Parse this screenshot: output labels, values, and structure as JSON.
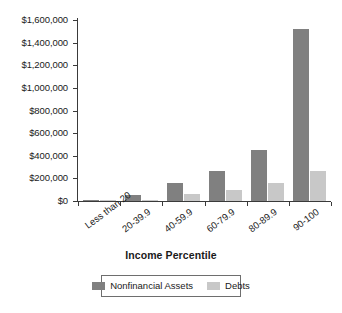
{
  "chart_data": {
    "type": "bar",
    "title": "",
    "xlabel": "Income Percentile",
    "ylabel": "",
    "categories": [
      "Less than 20",
      "20-39.9",
      "40-59.9",
      "60-79.9",
      "80-89.9",
      "90-100"
    ],
    "series": [
      {
        "name": "Nonfinancial Assets",
        "color": "#808080",
        "values": [
          10000,
          55000,
          150000,
          260000,
          435000,
          1470000
        ]
      },
      {
        "name": "Debts",
        "color": "#c8c8c8",
        "values": [
          5000,
          10000,
          60000,
          95000,
          150000,
          255000
        ]
      }
    ],
    "ylim": [
      0,
      1600000
    ],
    "ytick_labels": [
      "$1,600,000",
      "$1,400,000",
      "$1,200,000",
      "$1,000,000",
      "$800,000",
      "$600,000",
      "$400,000",
      "$200,000",
      "$0"
    ],
    "ytick_values": [
      1600000,
      1400000,
      1200000,
      1000000,
      800000,
      600000,
      400000,
      200000,
      0
    ],
    "grid": false,
    "legend_position": "bottom"
  }
}
